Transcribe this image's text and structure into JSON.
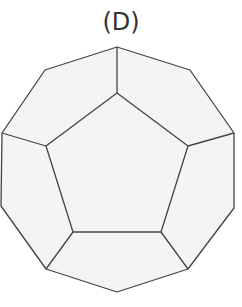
{
  "figure": {
    "label": "(D)",
    "shape": "dodecahedron",
    "view": "face-on, regular pentagon centered, 5 surrounding pentagonal faces",
    "fill_color": "#f4f4f4",
    "stroke_color": "#444444",
    "outer_outline": [
      [
        117,
        47
      ],
      [
        190,
        70
      ],
      [
        234,
        133
      ],
      [
        234,
        208
      ],
      [
        188,
        269
      ],
      [
        117,
        292
      ],
      [
        46,
        269
      ],
      [
        1,
        206
      ],
      [
        2,
        133
      ],
      [
        45,
        70
      ]
    ],
    "inner_pentagon": [
      [
        117,
        93
      ],
      [
        188,
        146
      ],
      [
        161,
        232
      ],
      [
        73,
        232
      ],
      [
        46,
        146
      ]
    ],
    "spokes": [
      [
        [
          117,
          47
        ],
        [
          117,
          93
        ]
      ],
      [
        [
          234,
          133
        ],
        [
          188,
          146
        ]
      ],
      [
        [
          188,
          269
        ],
        [
          161,
          232
        ]
      ],
      [
        [
          46,
          269
        ],
        [
          73,
          232
        ]
      ],
      [
        [
          2,
          133
        ],
        [
          46,
          146
        ]
      ]
    ]
  }
}
